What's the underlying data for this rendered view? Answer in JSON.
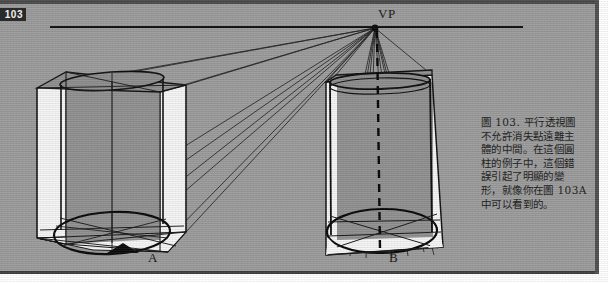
{
  "page": {
    "page_number": "103",
    "background_color": "#9b9b9b",
    "ink_color": "#111111",
    "cylinder_fill": "#8e8e8e",
    "box_face_fill": "#f2f2f2"
  },
  "diagram": {
    "vanishing_point_label": "VP",
    "horizon_line": {
      "x1": 50,
      "y1": 27,
      "x2": 523,
      "y2": 27
    },
    "vanishing_point": {
      "x": 375,
      "y": 28
    },
    "figures": [
      {
        "id": "A",
        "label": "A",
        "marker": "black-triangle-pointer"
      },
      {
        "id": "B",
        "label": "B",
        "marker": "none"
      }
    ]
  },
  "caption": {
    "lines": [
      "圖 103.  平行透視圖",
      "不允許消失點遠離主",
      "體的中間。在這個圓",
      "柱的例子中，這個錯",
      "誤引起了明顯的變",
      "形，就像你在圖 103A",
      "中可以看到的。"
    ]
  }
}
